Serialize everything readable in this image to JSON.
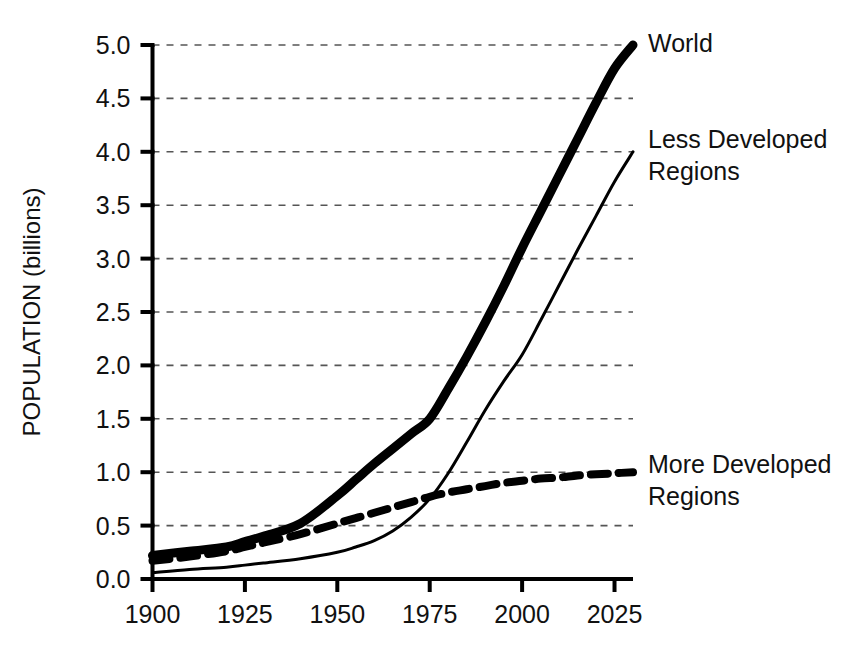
{
  "chart_data": {
    "type": "line",
    "title": "",
    "subtitle": "",
    "xlabel": "",
    "ylabel": "POPULATION (billions)",
    "xlim": [
      1900,
      2030
    ],
    "ylim": [
      0.0,
      5.0
    ],
    "grid": true,
    "grid_orientation": "horizontal",
    "grid_style": "dotted",
    "legend_position": "right-inline-annotations",
    "x_ticks": [
      1900,
      1925,
      1950,
      1975,
      2000,
      2025
    ],
    "x_tick_labels": [
      "1900",
      "1925",
      "1950",
      "1975",
      "2000",
      "2025"
    ],
    "y_ticks": [
      0.0,
      0.5,
      1.0,
      1.5,
      2.0,
      2.5,
      3.0,
      3.5,
      4.0,
      4.5,
      5.0
    ],
    "y_tick_labels": [
      "0.0",
      "0.5",
      "1.0",
      "1.5",
      "2.0",
      "2.5",
      "3.0",
      "3.5",
      "4.0",
      "4.5",
      "5.0"
    ],
    "x": [
      1900,
      1910,
      1920,
      1925,
      1930,
      1940,
      1950,
      1955,
      1960,
      1965,
      1970,
      1975,
      1980,
      1985,
      1990,
      1995,
      2000,
      2005,
      2010,
      2015,
      2020,
      2025,
      2030
    ],
    "series": [
      {
        "name": "World",
        "style": "thick-solid",
        "color": "#000000",
        "line_width": 9,
        "values": [
          0.22,
          0.26,
          0.3,
          0.35,
          0.4,
          0.52,
          0.78,
          0.93,
          1.08,
          1.22,
          1.36,
          1.5,
          1.78,
          2.08,
          2.4,
          2.74,
          3.1,
          3.44,
          3.78,
          4.12,
          4.46,
          4.78,
          5.0
        ],
        "label_text": "World",
        "label_value": 5.0
      },
      {
        "name": "Less Developed Regions",
        "style": "thin-solid",
        "color": "#000000",
        "line_width": 3,
        "values": [
          0.06,
          0.09,
          0.11,
          0.13,
          0.15,
          0.19,
          0.25,
          0.3,
          0.36,
          0.45,
          0.58,
          0.75,
          0.99,
          1.28,
          1.58,
          1.85,
          2.1,
          2.42,
          2.75,
          3.08,
          3.4,
          3.72,
          4.0
        ],
        "label_text": "Less Developed Regions",
        "label_value": 4.0
      },
      {
        "name": "More Developed Regions",
        "style": "dashed",
        "color": "#000000",
        "line_width": 8,
        "values": [
          0.17,
          0.21,
          0.26,
          0.3,
          0.34,
          0.42,
          0.52,
          0.57,
          0.62,
          0.67,
          0.72,
          0.77,
          0.81,
          0.84,
          0.87,
          0.9,
          0.92,
          0.94,
          0.95,
          0.97,
          0.98,
          0.99,
          1.0
        ],
        "label_text": "More Developed Regions",
        "label_value": 1.0
      }
    ],
    "annotations": [
      {
        "text": "World",
        "line1": "World",
        "line2": ""
      },
      {
        "text": "Less Developed Regions",
        "line1": "Less Developed",
        "line2": "Regions"
      },
      {
        "text": "More Developed Regions",
        "line1": "More Developed",
        "line2": "Regions"
      }
    ]
  },
  "axes": {
    "y_title": "POPULATION (billions)",
    "y_labels": {
      "t0": "0.0",
      "t1": "0.5",
      "t2": "1.0",
      "t3": "1.5",
      "t4": "2.0",
      "t5": "2.5",
      "t6": "3.0",
      "t7": "3.5",
      "t8": "4.0",
      "t9": "4.5",
      "t10": "5.0"
    },
    "x_labels": {
      "t0": "1900",
      "t1": "1925",
      "t2": "1950",
      "t3": "1975",
      "t4": "2000",
      "t5": "2025"
    }
  },
  "labels": {
    "world_1": "World",
    "less_1": "Less Developed",
    "less_2": "Regions",
    "more_1": "More Developed",
    "more_2": "Regions"
  },
  "colors": {
    "ink": "#000000",
    "grid": "#555555",
    "background": "#ffffff"
  }
}
